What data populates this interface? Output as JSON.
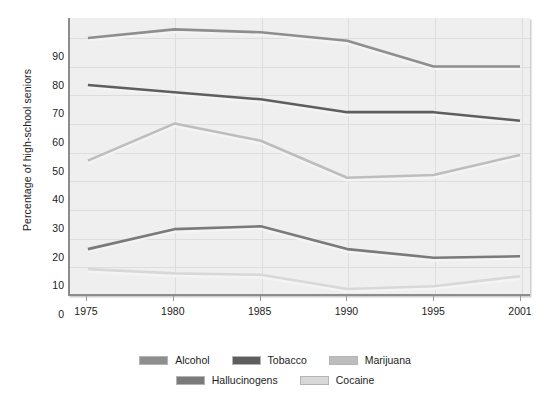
{
  "chart_data": {
    "type": "line",
    "title": "",
    "xlabel": "",
    "ylabel": "Percentage of high-school seniors",
    "x": [
      1975,
      1980,
      1985,
      1990,
      1995,
      2001
    ],
    "xtick_labels": [
      "1975",
      "1980",
      "1985",
      "1990",
      "1995",
      "2001"
    ],
    "ytick_labels": [
      "90",
      "80",
      "70",
      "60",
      "50",
      "40",
      "30",
      "20",
      "10",
      "0"
    ],
    "ytick_values": [
      90,
      80,
      70,
      60,
      50,
      40,
      30,
      20,
      10,
      0
    ],
    "ylim": [
      0,
      97
    ],
    "xlim": [
      1975,
      2001
    ],
    "grid": true,
    "legend_position": "bottom",
    "series": [
      {
        "name": "Alcohol",
        "color": "#8e8e8e",
        "values": [
          90,
          93,
          92,
          89,
          80,
          80
        ]
      },
      {
        "name": "Tobacco",
        "color": "#5e5e5e",
        "values": [
          73.5,
          71,
          68.5,
          64,
          64,
          61
        ]
      },
      {
        "name": "Marijuana",
        "color": "#bdbdbd",
        "values": [
          47,
          60,
          54,
          41,
          42,
          49
        ]
      },
      {
        "name": "Hallucinogens",
        "color": "#7a7a7a",
        "values": [
          16,
          23,
          24,
          16,
          13,
          13.5
        ]
      },
      {
        "name": "Cocaine",
        "color": "#d8d8d8",
        "values": [
          9,
          7.5,
          7,
          2,
          3,
          6.5
        ]
      }
    ]
  },
  "legend": {
    "rows": [
      [
        "Alcohol",
        "Tobacco",
        "Marijuana"
      ],
      [
        "Hallucinogens",
        "Cocaine"
      ]
    ]
  },
  "colors": {
    "plot_background": "#efefef",
    "grid": "#dddddd",
    "axis": "#8c8c8c",
    "text": "#1c1c1c",
    "page_background": "#ffffff"
  }
}
